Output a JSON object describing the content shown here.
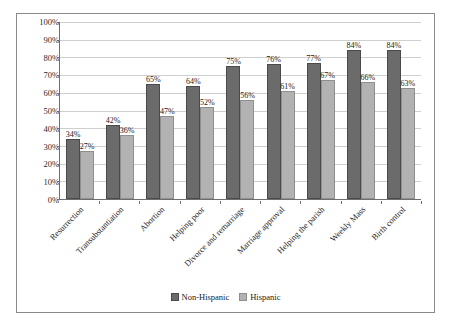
{
  "chart_data": {
    "type": "bar",
    "title": "",
    "subtitle": "",
    "xlabel": "",
    "ylabel": "",
    "ylim": [
      0,
      100
    ],
    "ytick_labels": [
      "0%",
      "10%",
      "20%",
      "30%",
      "40%",
      "50%",
      "60%",
      "70%",
      "80%",
      "90%",
      "100%"
    ],
    "ytick_values": [
      0,
      10,
      20,
      30,
      40,
      50,
      60,
      70,
      80,
      90,
      100
    ],
    "grid": true,
    "legend_position": "bottom",
    "categories": [
      "Resurrection",
      "Transubstantiation",
      "Abortion",
      "Helping poor",
      "Divorce and remarriage",
      "Marriage approval",
      "Helping the parish",
      "Weekly Mass",
      "Birth control"
    ],
    "series": [
      {
        "name": "Non-Hispanic",
        "color": "#6b6b6b",
        "values": [
          34,
          42,
          65,
          64,
          75,
          76,
          77,
          84,
          84
        ],
        "labels": [
          "34%",
          "42%",
          "65%",
          "64%",
          "75%",
          "76%",
          "77%",
          "84%",
          "84%"
        ]
      },
      {
        "name": "Hispanic",
        "color": "#b2b2b2",
        "values": [
          27,
          36,
          47,
          52,
          56,
          61,
          67,
          66,
          63
        ],
        "labels": [
          "27%",
          "36%",
          "47%",
          "52%",
          "56%",
          "61%",
          "67%",
          "66%",
          "63%"
        ]
      }
    ]
  }
}
